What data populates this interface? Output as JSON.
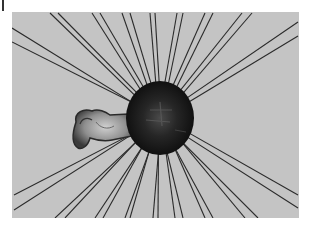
{
  "figure": {
    "background_color": "#c4c4c4",
    "line_color": "#2a2a2a",
    "body_color": "#151515",
    "appendage_color": "#8a8a8a",
    "body": {
      "cx": 160,
      "cy": 118,
      "rx": 34,
      "ry": 37
    },
    "appendage": {
      "cx": 98,
      "cy": 130
    },
    "ray_pairs": [
      [
        [
          12,
          28
        ],
        [
          12,
          42
        ]
      ],
      [
        [
          50,
          13
        ],
        [
          58,
          13
        ]
      ],
      [
        [
          92,
          13
        ],
        [
          100,
          13
        ]
      ],
      [
        [
          122,
          13
        ],
        [
          130,
          13
        ]
      ],
      [
        [
          150,
          13
        ],
        [
          155,
          13
        ]
      ],
      [
        [
          177,
          13
        ],
        [
          183,
          13
        ]
      ],
      [
        [
          205,
          13
        ],
        [
          213,
          13
        ]
      ],
      [
        [
          242,
          13
        ],
        [
          252,
          13
        ]
      ],
      [
        [
          298,
          22
        ],
        [
          298,
          36
        ]
      ],
      [
        [
          298,
          195
        ],
        [
          298,
          208
        ]
      ],
      [
        [
          245,
          218
        ],
        [
          258,
          218
        ]
      ],
      [
        [
          205,
          218
        ],
        [
          213,
          218
        ]
      ],
      [
        [
          175,
          218
        ],
        [
          183,
          218
        ]
      ],
      [
        [
          153,
          218
        ],
        [
          158,
          218
        ]
      ],
      [
        [
          125,
          218
        ],
        [
          130,
          218
        ]
      ],
      [
        [
          95,
          218
        ],
        [
          103,
          218
        ]
      ],
      [
        [
          55,
          218
        ],
        [
          65,
          218
        ]
      ],
      [
        [
          14,
          195
        ],
        [
          14,
          210
        ]
      ]
    ]
  }
}
